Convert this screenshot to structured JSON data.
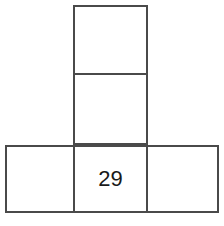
{
  "figure": {
    "type": "square-net",
    "canvas": {
      "width": 224,
      "height": 226,
      "background": "#ffffff"
    },
    "stroke": {
      "color": "#4a4a4a",
      "width": 2
    },
    "grid": {
      "cell_width": 75,
      "cell_height": 70,
      "origin_x": 5,
      "origin_y": 5,
      "column_left": 73,
      "column_right": 148,
      "row_top": 145,
      "row_bottom": 213
    },
    "cells": [
      {
        "id": "top-square",
        "name": "top-square",
        "row": 0,
        "col": 1,
        "x": 73,
        "y": 5,
        "width": 75,
        "height": 70,
        "label": ""
      },
      {
        "id": "middle-square",
        "name": "middle-square",
        "row": 1,
        "col": 1,
        "x": 73,
        "y": 75,
        "width": 75,
        "height": 70,
        "label": ""
      },
      {
        "id": "bottom-left-square",
        "name": "bottom-left-square",
        "row": 2,
        "col": 0,
        "x": 5,
        "y": 145,
        "width": 68,
        "height": 68,
        "label": ""
      },
      {
        "id": "bottom-center-square",
        "name": "bottom-center-square",
        "row": 2,
        "col": 1,
        "x": 73,
        "y": 145,
        "width": 75,
        "height": 68,
        "label": "29"
      },
      {
        "id": "bottom-right-square",
        "name": "bottom-right-square",
        "row": 2,
        "col": 2,
        "x": 148,
        "y": 145,
        "width": 71,
        "height": 68,
        "label": ""
      }
    ],
    "labels": {
      "bottom_center_value": "29"
    }
  }
}
